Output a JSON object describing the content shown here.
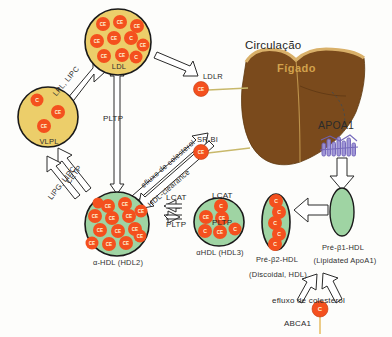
{
  "diagram": {
    "title_circulation": "Circulação",
    "liver_label": "Fígado",
    "apoa1_label": "APOA1",
    "abca1_label": "ABCA1",
    "receptors": [
      {
        "name": "LDLR",
        "cargo": "CE"
      },
      {
        "name": "SR-BI",
        "cargo": "CE"
      }
    ],
    "particles": [
      {
        "id": "vldl",
        "label": "VLPL",
        "type": "yellow-sphere",
        "contents": [
          "C",
          "CE",
          "CE"
        ]
      },
      {
        "id": "ldl",
        "label": "LDL",
        "type": "yellow-sphere",
        "contents": [
          "CE",
          "CE",
          "CE",
          "CE",
          "CE",
          "C",
          "CE",
          "CE",
          "CE",
          "C"
        ]
      },
      {
        "id": "hdl2",
        "label": "α-HDL (HDL2)",
        "type": "green-sphere",
        "contents": [
          "CE",
          "CE",
          "CE",
          "CE",
          "CE",
          "CE",
          "CE",
          "CE",
          "CE",
          "CE",
          "CE",
          "CE",
          "CE",
          "CE"
        ]
      },
      {
        "id": "hdl3",
        "label": "αHDL (HDL3)",
        "type": "green-sphere",
        "contents": [
          "C",
          "CE",
          "CE",
          "C",
          "CE",
          "C"
        ]
      },
      {
        "id": "prebeta2",
        "label": "Pré-β2-HDL",
        "sublabel": "(Discoidal, HDL)",
        "type": "green-disc",
        "contents": [
          "C",
          "C",
          "C",
          "C",
          "C"
        ]
      },
      {
        "id": "prebeta1",
        "label": "Pré-β1-HDL",
        "sublabel": "(Lipidated ApoA1)",
        "type": "green-disc-empty",
        "contents": []
      }
    ],
    "enzymes": {
      "lpl_lipc": "LPL, LIPC",
      "pltp_center": "PLTP",
      "cetp": "CETP",
      "lipg_lipc": "LIPG, LIPC",
      "efflux_upper": "efluxo de colesterol",
      "hdl_clearance": "HDL-clearance",
      "lcat_left": "LCAT",
      "pltp_left": "PLTP",
      "lcat_right": "LCAT",
      "pltp_right": "PLTP",
      "efflux_bottom": "efluxo de colesterol"
    },
    "molecules": {
      "cholesterol": "C",
      "cholesteryl_ester": "CE"
    },
    "colors": {
      "yellow_particle": "#ecce6a",
      "green_particle": "#9fd4a3",
      "orange_molecule": "#f4501e",
      "liver_brown": "#7a4a1c",
      "liver_gold": "#d2a24c",
      "apoa1_purple": "#6f62b8",
      "outline": "#1a1a1a"
    }
  }
}
